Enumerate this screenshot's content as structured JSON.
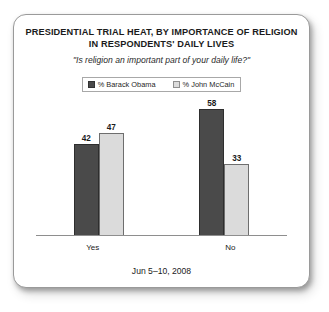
{
  "card": {
    "title_lines": [
      "PRESIDENTIAL TRIAL HEAT, BY IMPORTANCE OF RELIGION",
      "IN RESPONDENTS' DAILY LIVES"
    ],
    "subtitle": "\"Is religion an important part of your daily life?\"",
    "footer_date": "Jun 5–10, 2008"
  },
  "colors": {
    "obama": "#4a4a4a",
    "mccain": "#dbdbdb",
    "axis": "#8e8e8e",
    "text": "#1b1b1b",
    "card_border": "#9a9a9a"
  },
  "chart_data": {
    "type": "bar",
    "title": "PRESIDENTIAL TRIAL HEAT, BY IMPORTANCE OF RELIGION IN RESPONDENTS' DAILY LIVES",
    "subtitle": "\"Is religion an important part of your daily life?\"",
    "xlabel": "",
    "ylabel": "",
    "ylim": [
      0,
      62
    ],
    "grid": false,
    "legend_position": "top-center",
    "categories": [
      "Yes",
      "No"
    ],
    "series": [
      {
        "name": "% Barack Obama",
        "color": "#4a4a4a",
        "values": [
          42,
          58
        ]
      },
      {
        "name": "% John McCain",
        "color": "#dbdbdb",
        "values": [
          47,
          33
        ]
      }
    ],
    "annotations": [
      "Jun 5–10, 2008"
    ]
  }
}
